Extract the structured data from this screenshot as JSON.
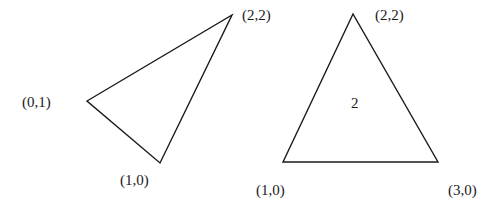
{
  "colors": {
    "background": "#ffffff",
    "stroke": "#1a1a1a",
    "text": "#1a1a1a"
  },
  "diagram": {
    "triangles": [
      {
        "name": "left-triangle",
        "vertices": [
          {
            "x": 87,
            "y": 101,
            "label": "(0,1)"
          },
          {
            "x": 232,
            "y": 15,
            "label": "(2,2)"
          },
          {
            "x": 160,
            "y": 163,
            "label": "(1,0)"
          }
        ],
        "center_label": ""
      },
      {
        "name": "right-triangle",
        "vertices": [
          {
            "x": 353,
            "y": 14,
            "label": "(2,2)"
          },
          {
            "x": 283,
            "y": 162,
            "label": "(1,0)"
          },
          {
            "x": 438,
            "y": 162,
            "label": "(3,0)"
          }
        ],
        "center_label": "2"
      }
    ],
    "labels": {
      "left_top": "(2,2)",
      "left_left": "(0,1)",
      "left_bottom": "(1,0)",
      "right_top": "(2,2)",
      "right_center": "2",
      "right_bottom_left": "(1,0)",
      "right_bottom_right": "(3,0)"
    }
  }
}
